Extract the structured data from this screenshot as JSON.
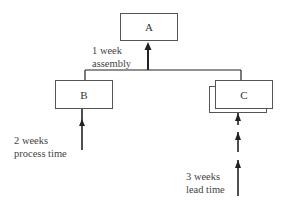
{
  "diagram": {
    "nodes": {
      "a": {
        "label": "A"
      },
      "b": {
        "label": "B"
      },
      "c": {
        "label": "C"
      }
    },
    "annotations": {
      "assembly": {
        "line1": "1 week",
        "line2": "assembly"
      },
      "process": {
        "line1": "2 weeks",
        "line2": "process time"
      },
      "lead": {
        "line1": "3 weeks",
        "line2": "lead time"
      }
    },
    "colors": {
      "line": "#222222",
      "box_border": "#555555"
    }
  }
}
